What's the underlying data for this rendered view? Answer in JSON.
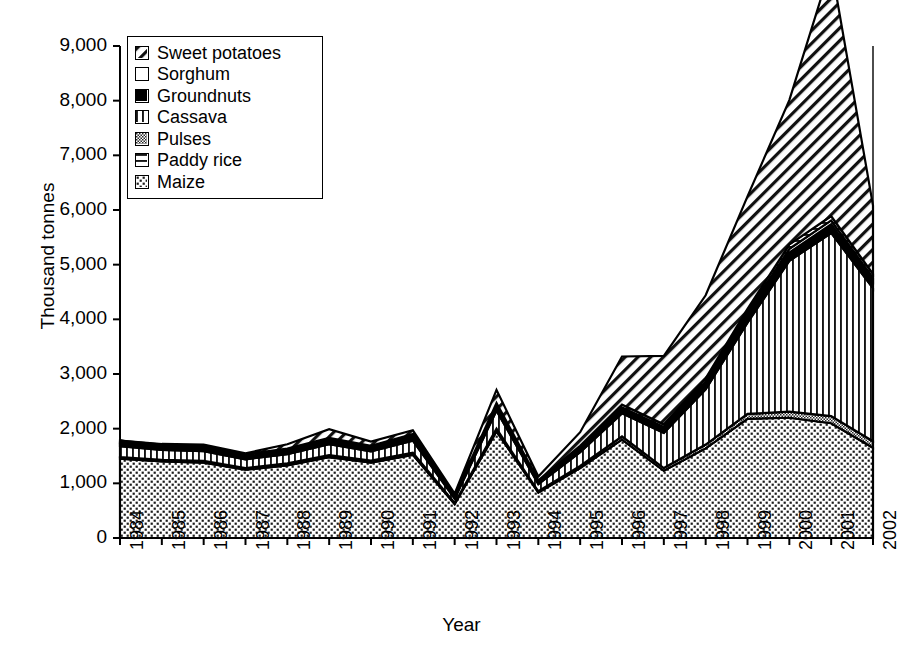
{
  "chart_data": {
    "type": "area",
    "stacked": true,
    "title": "",
    "xlabel": "Year",
    "ylabel": "Thousand tonnes",
    "x": [
      1984,
      1985,
      1986,
      1987,
      1988,
      1989,
      1990,
      1991,
      1992,
      1993,
      1994,
      1995,
      1996,
      1997,
      1998,
      1999,
      2000,
      2001,
      2002
    ],
    "categories": [
      "1984",
      "1985",
      "1986",
      "1987",
      "1988",
      "1989",
      "1990",
      "1991",
      "1992",
      "1993",
      "1994",
      "1995",
      "1996",
      "1997",
      "1998",
      "1999",
      "2000",
      "2001",
      "2002"
    ],
    "ylim": [
      0,
      9000
    ],
    "ytick_values": [
      0,
      1000,
      2000,
      3000,
      4000,
      5000,
      6000,
      7000,
      8000,
      9000
    ],
    "ytick_labels": [
      "0",
      "1,000",
      "2,000",
      "3,000",
      "4,000",
      "5,000",
      "6,000",
      "7,000",
      "8,000",
      "9,000"
    ],
    "grid": false,
    "legend_position": "top-left",
    "stack_order_bottom_to_top": [
      "Maize",
      "Pulses",
      "Cassava",
      "Groundnuts",
      "Sorghum",
      "Paddy rice",
      "Sweet potatoes"
    ],
    "series": [
      {
        "name": "Maize",
        "values": [
          1450,
          1400,
          1380,
          1250,
          1330,
          1480,
          1380,
          1520,
          620,
          1950,
          830,
          1280,
          1800,
          1230,
          1640,
          2180,
          2200,
          2100,
          1650
        ]
      },
      {
        "name": "Pulses",
        "values": [
          30,
          30,
          30,
          30,
          35,
          35,
          35,
          40,
          20,
          50,
          25,
          40,
          60,
          50,
          70,
          90,
          110,
          130,
          120
        ]
      },
      {
        "name": "Cassava",
        "values": [
          200,
          180,
          180,
          160,
          170,
          200,
          170,
          220,
          80,
          330,
          130,
          250,
          420,
          640,
          1010,
          1670,
          2760,
          3350,
          2800
        ]
      },
      {
        "name": "Groundnuts",
        "values": [
          40,
          40,
          40,
          35,
          40,
          45,
          40,
          50,
          20,
          60,
          30,
          50,
          70,
          70,
          90,
          120,
          150,
          160,
          130
        ]
      },
      {
        "name": "Sorghum",
        "values": [
          25,
          25,
          25,
          25,
          25,
          30,
          25,
          30,
          15,
          35,
          20,
          30,
          40,
          40,
          50,
          60,
          70,
          70,
          60
        ]
      },
      {
        "name": "Paddy rice",
        "values": [
          35,
          35,
          35,
          30,
          35,
          40,
          35,
          40,
          15,
          45,
          20,
          35,
          50,
          50,
          60,
          70,
          80,
          80,
          70
        ]
      },
      {
        "name": "Sweet potatoes",
        "values": [
          0,
          10,
          20,
          20,
          80,
          160,
          80,
          70,
          40,
          240,
          70,
          250,
          880,
          1250,
          1520,
          2060,
          2640,
          4580,
          1250
        ]
      }
    ],
    "series_styles": [
      {
        "name": "Maize",
        "pattern": "maize-dots"
      },
      {
        "name": "Pulses",
        "pattern": "pulses-fine"
      },
      {
        "name": "Cassava",
        "pattern": "cassava-vertical"
      },
      {
        "name": "Groundnuts",
        "pattern": "groundnuts-solid"
      },
      {
        "name": "Sorghum",
        "pattern": "sorghum-blank"
      },
      {
        "name": "Paddy rice",
        "pattern": "paddyrice-horizontal"
      },
      {
        "name": "Sweet potatoes",
        "pattern": "sweetpotato-diagonal"
      }
    ]
  },
  "legend": {
    "items": [
      {
        "label": "Sweet potatoes",
        "swatch": "sweetpotato-diagonal"
      },
      {
        "label": "Sorghum",
        "swatch": "sorghum-blank"
      },
      {
        "label": "Groundnuts",
        "swatch": "groundnuts-solid"
      },
      {
        "label": "Cassava",
        "swatch": "cassava-vertical"
      },
      {
        "label": "Pulses",
        "swatch": "pulses-fine"
      },
      {
        "label": "Paddy rice",
        "swatch": "paddyrice-horizontal"
      },
      {
        "label": "Maize",
        "swatch": "maize-dots"
      }
    ]
  },
  "axes": {
    "y_title": "Thousand tonnes",
    "x_title": "Year"
  },
  "colors": {
    "line": "#000000",
    "background": "#ffffff",
    "pulses_fill": "#9a9a9a"
  }
}
